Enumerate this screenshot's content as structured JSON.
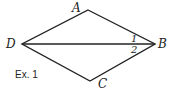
{
  "figure": {
    "caption": "Ex. 1",
    "vertices": {
      "A": {
        "label": "A"
      },
      "B": {
        "label": "B"
      },
      "C": {
        "label": "C"
      },
      "D": {
        "label": "D"
      }
    },
    "angles": {
      "angle1": "1",
      "angle2": "2"
    },
    "stroke_color": "#222222"
  }
}
